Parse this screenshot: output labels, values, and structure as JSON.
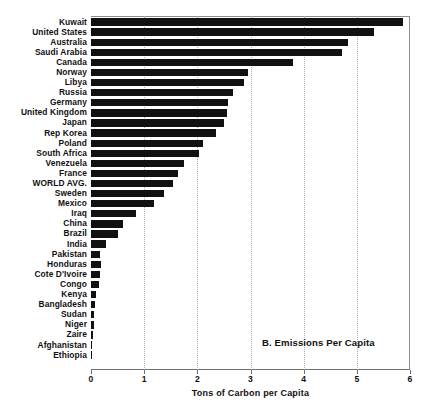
{
  "chart_data": {
    "type": "bar",
    "orientation": "horizontal",
    "title": "B. Emissions Per Capita",
    "subtitle": "",
    "xlabel": "Tons of Carbon per Capita",
    "ylabel": "",
    "xlim": [
      0,
      6
    ],
    "xticks": [
      0,
      1,
      2,
      3,
      4,
      5,
      6
    ],
    "xtick_labels": [
      "0",
      "1",
      "2",
      "3",
      "4",
      "5",
      "6"
    ],
    "grid": "vertical-dotted",
    "legend": "none",
    "bar_color": "#111111",
    "categories": [
      "Kuwait",
      "United States",
      "Australia",
      "Saudi Arabia",
      "Canada",
      "Norway",
      "Libya",
      "Russia",
      "Germany",
      "United Kingdom",
      "Japan",
      "Rep Korea",
      "Poland",
      "South Africa",
      "Venezuela",
      "France",
      "WORLD AVG.",
      "Sweden",
      "Mexico",
      "Iraq",
      "China",
      "Brazil",
      "India",
      "Pakistan",
      "Honduras",
      "Cote D'Ivoire",
      "Congo",
      "Kenya",
      "Bangladesh",
      "Sudan",
      "Niger",
      "Zaire",
      "Afghanistan",
      "Ethiopia"
    ],
    "values": [
      5.87,
      5.32,
      4.83,
      4.72,
      3.8,
      2.95,
      2.88,
      2.67,
      2.58,
      2.55,
      2.5,
      2.36,
      2.11,
      2.03,
      1.74,
      1.64,
      1.54,
      1.37,
      1.19,
      0.85,
      0.6,
      0.51,
      0.28,
      0.17,
      0.18,
      0.16,
      0.15,
      0.09,
      0.08,
      0.06,
      0.05,
      0.03,
      0.02,
      0.02
    ]
  }
}
